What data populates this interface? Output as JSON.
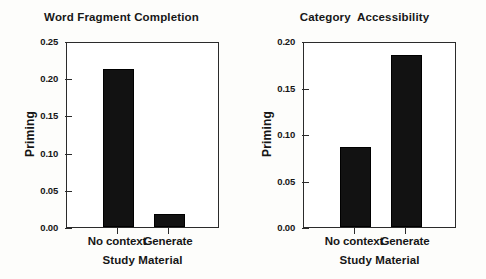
{
  "figure": {
    "background_color": "#fdfdfb",
    "bar_color": "#121212",
    "axis_color": "#2b2b2b"
  },
  "chart_data": [
    {
      "type": "bar",
      "title": "Word Fragment Completion",
      "xlabel": "Study Material",
      "ylabel": "Priming",
      "categories": [
        "No context",
        "Generate"
      ],
      "values": [
        0.212,
        0.018
      ],
      "ylim": [
        0.0,
        0.25
      ],
      "yticks": [
        0.0,
        0.05,
        0.1,
        0.15,
        0.2,
        0.25
      ],
      "ytick_labels": [
        "0.00",
        "0.05",
        "0.10",
        "0.15",
        "0.20",
        "0.25"
      ],
      "grid": false,
      "legend": null
    },
    {
      "type": "bar",
      "title": "Category  Accessibility",
      "xlabel": "Study Material",
      "ylabel": "Priming",
      "categories": [
        "No context",
        "Generate"
      ],
      "values": [
        0.086,
        0.185
      ],
      "ylim": [
        0.0,
        0.2
      ],
      "yticks": [
        0.0,
        0.05,
        0.1,
        0.15,
        0.2
      ],
      "ytick_labels": [
        "0.00",
        "0.05",
        "0.10",
        "0.15",
        "0.20"
      ],
      "grid": false,
      "legend": null
    }
  ]
}
